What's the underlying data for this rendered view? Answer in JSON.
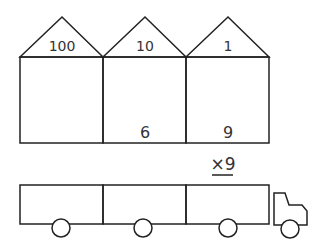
{
  "houses": [
    {
      "place_value": "100",
      "digit": ""
    },
    {
      "place_value": "10",
      "digit": "6"
    },
    {
      "place_value": "1",
      "digit": "9"
    }
  ],
  "multiplier": "×9",
  "truck": {
    "compartments": 3,
    "wheels": 4
  }
}
